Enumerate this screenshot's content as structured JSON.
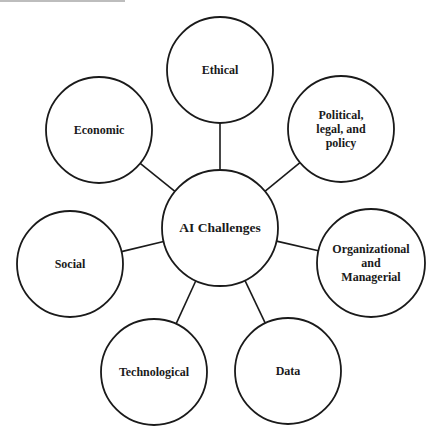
{
  "diagram": {
    "type": "hub-and-spoke",
    "center": {
      "label": "AI Challenges",
      "x": 220,
      "y": 228,
      "r": 58
    },
    "nodes": [
      {
        "id": "ethical",
        "label": "Ethical",
        "x": 220,
        "y": 70,
        "r": 53
      },
      {
        "id": "political",
        "label": "Political,\nlegal, and\npolicy",
        "x": 341,
        "y": 129,
        "r": 53
      },
      {
        "id": "organizational",
        "label": "Organizational\nand Managerial",
        "x": 371,
        "y": 263,
        "r": 54
      },
      {
        "id": "data",
        "label": "Data",
        "x": 288,
        "y": 371,
        "r": 53
      },
      {
        "id": "technological",
        "label": "Technological",
        "x": 154,
        "y": 372,
        "r": 53
      },
      {
        "id": "social",
        "label": "Social",
        "x": 70,
        "y": 264,
        "r": 53
      },
      {
        "id": "economic",
        "label": "Economic",
        "x": 99,
        "y": 130,
        "r": 53
      }
    ],
    "colors": {
      "stroke": "#1a1a1a",
      "fill": "#ffffff",
      "text": "#1a1a1a"
    }
  }
}
